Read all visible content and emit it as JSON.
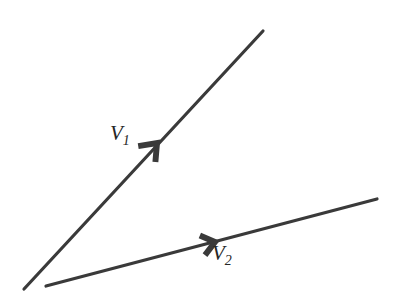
{
  "figure": {
    "type": "vector-diagram",
    "background_color": "#ffffff",
    "stroke_color": "#3a3a3a",
    "label_color": "#262626",
    "width": 401,
    "height": 298
  },
  "vectors": [
    {
      "id": "v1",
      "name": "vector-v1",
      "label_base": "V",
      "label_subscript": "1",
      "stroke_color": "#3a3a3a",
      "stroke_width": 3.2,
      "start": {
        "x": 24,
        "y": 289
      },
      "end": {
        "x": 263,
        "y": 31
      },
      "arrow_at": {
        "x": 157,
        "y": 143
      },
      "arrow_size": 15,
      "arrow_style": "chevron",
      "label_position": {
        "x": 110,
        "y": 123
      }
    },
    {
      "id": "v2",
      "name": "vector-v2",
      "label_base": "V",
      "label_subscript": "2",
      "stroke_color": "#3a3a3a",
      "stroke_width": 3.2,
      "start": {
        "x": 46,
        "y": 286
      },
      "end": {
        "x": 377,
        "y": 199
      },
      "arrow_at": {
        "x": 215,
        "y": 242
      },
      "arrow_size": 13,
      "arrow_style": "chevron",
      "label_position": {
        "x": 212,
        "y": 243
      }
    }
  ],
  "labels": {
    "v1": {
      "base": "V",
      "sub": "1"
    },
    "v2": {
      "base": "V",
      "sub": "2"
    }
  }
}
